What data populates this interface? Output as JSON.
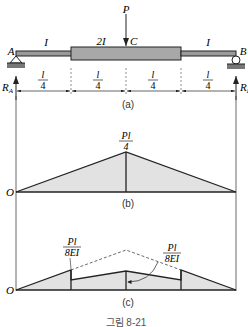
{
  "figure": {
    "caption": "그림 8-21",
    "colors": {
      "line": "#222222",
      "thick_beam_fill": "#a8a8a8",
      "thin_beam_fill": "#9a9a9a",
      "diagram_fill": "#e2e2e2",
      "ground_fill": "#777777"
    }
  },
  "panel_a": {
    "label": "(a)",
    "load": "P",
    "point_load_label": "C",
    "support_left": "A",
    "support_right": "B",
    "reaction_left": "R",
    "reaction_left_sub": "A",
    "reaction_right": "R",
    "reaction_right_sub": "B",
    "segments": [
      {
        "inertia": "I"
      },
      {
        "inertia": "2I"
      },
      {
        "inertia": "I"
      }
    ],
    "dimensions": [
      {
        "num": "l",
        "den": "4"
      },
      {
        "num": "l",
        "den": "4"
      },
      {
        "num": "l",
        "den": "4"
      },
      {
        "num": "l",
        "den": "4"
      }
    ]
  },
  "panel_b": {
    "label": "(b)",
    "origin": "O",
    "peak_num": "Pl",
    "peak_den": "4"
  },
  "panel_c": {
    "label": "(c)",
    "origin": "O",
    "left_num": "Pl",
    "left_den": "8EI",
    "right_num": "Pl",
    "right_den": "8EI"
  }
}
